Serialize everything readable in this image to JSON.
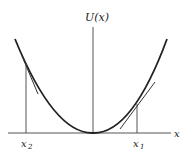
{
  "diagram": {
    "y_axis_label": "U(x)",
    "x_axis_label": "x",
    "points": [
      {
        "name": "x2",
        "label_main": "x",
        "label_sub": "2",
        "side": "left"
      },
      {
        "name": "x1",
        "label_main": "x",
        "label_sub": "1",
        "side": "right"
      }
    ],
    "curve": "parabola-like potential well with minimum at origin",
    "colors": {
      "curve": "#222222",
      "axes": "#555555",
      "background": "#ffffff"
    }
  }
}
